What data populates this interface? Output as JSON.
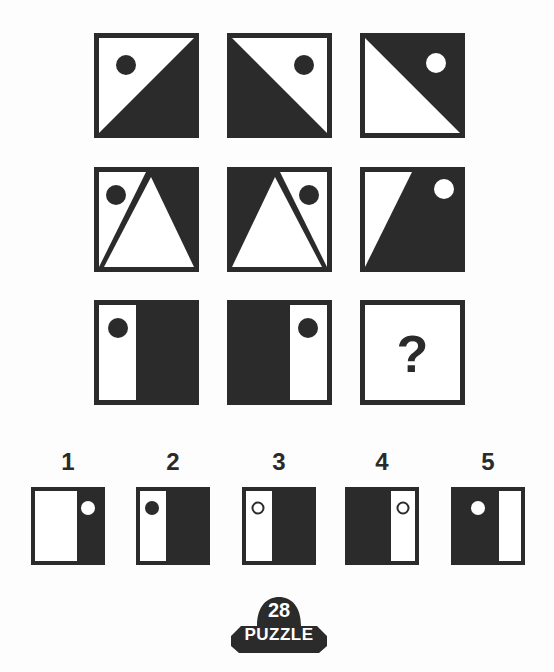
{
  "colors": {
    "ink": "#2b2b2b",
    "paper": "#ffffff",
    "background": "#fdfdfd"
  },
  "grid": {
    "rows": [
      [
        {
          "id": "r1c1",
          "description": "white upper-left triangle, black lower-right triangle, black dot top-left"
        },
        {
          "id": "r1c2",
          "description": "black lower-left triangle, white upper-right triangle, black dot top-right"
        },
        {
          "id": "r1c3",
          "description": "black upper-right triangle, white lower-left triangle, white dot top-right"
        }
      ],
      [
        {
          "id": "r2c1",
          "description": "white triangle left with black dot, black right area, white center triangle"
        },
        {
          "id": "r2c2",
          "description": "black left area, white triangle right with black dot, white center triangle"
        },
        {
          "id": "r2c3",
          "description": "white left slanted area, black right area with white dot"
        }
      ],
      [
        {
          "id": "r3c1",
          "description": "white left strip with black dot, black right"
        },
        {
          "id": "r3c2",
          "description": "black left, white right strip with black dot"
        },
        {
          "id": "r3c3",
          "description": "missing",
          "symbol": "?"
        }
      ]
    ]
  },
  "options": [
    {
      "label": "1",
      "description": "white left, black right with white dot"
    },
    {
      "label": "2",
      "description": "white left strip with black dot, black right"
    },
    {
      "label": "3",
      "description": "white left strip with hollow ring, black right"
    },
    {
      "label": "4",
      "description": "black left, white right strip with hollow ring"
    },
    {
      "label": "5",
      "description": "black left with white dot, white right strip"
    }
  ],
  "badge": {
    "number": "28",
    "label": "PUZZLE"
  }
}
